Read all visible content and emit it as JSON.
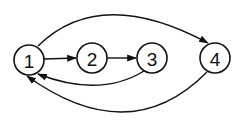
{
  "diagram": {
    "type": "directed-graph",
    "nodes": [
      {
        "id": "1",
        "label": "1",
        "cx": 29,
        "cy": 60
      },
      {
        "id": "2",
        "label": "2",
        "cx": 92,
        "cy": 58
      },
      {
        "id": "3",
        "label": "3",
        "cx": 152,
        "cy": 58
      },
      {
        "id": "4",
        "label": "4",
        "cx": 215,
        "cy": 58
      }
    ],
    "edges": [
      {
        "from": "1",
        "to": "2"
      },
      {
        "from": "2",
        "to": "3"
      },
      {
        "from": "3",
        "to": "1"
      },
      {
        "from": "1",
        "to": "4"
      },
      {
        "from": "4",
        "to": "1"
      }
    ],
    "colors": {
      "stroke": "#111111",
      "background": "#ffffff"
    }
  }
}
